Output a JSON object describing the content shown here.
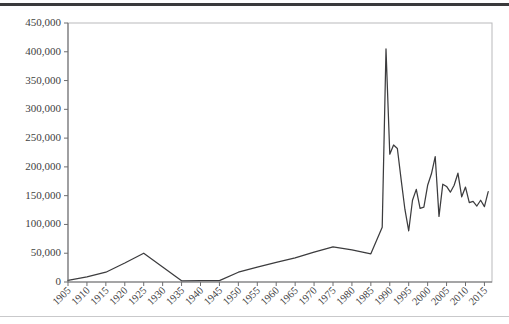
{
  "chart_data": {
    "type": "line",
    "title": "",
    "subtitle": "",
    "xlabel": "",
    "ylabel": "",
    "xlim": [
      1905,
      2017
    ],
    "ylim": [
      0,
      450000
    ],
    "grid": false,
    "legend": null,
    "legend_position": "none",
    "y_ticks": [
      0,
      50000,
      100000,
      150000,
      200000,
      250000,
      300000,
      350000,
      400000,
      450000
    ],
    "y_tick_labels": [
      "0",
      "50,000",
      "100,000",
      "150,000",
      "200,000",
      "250,000",
      "300,000",
      "350,000",
      "400,000",
      "450,000"
    ],
    "x_ticks": [
      1905,
      1910,
      1915,
      1920,
      1925,
      1930,
      1935,
      1940,
      1945,
      1950,
      1955,
      1960,
      1965,
      1970,
      1975,
      1980,
      1985,
      1990,
      1995,
      2000,
      2005,
      2010,
      2015
    ],
    "x_tick_labels": [
      "1905",
      "1910",
      "1915",
      "1920",
      "1925",
      "1930",
      "1935",
      "1940",
      "1945",
      "1950",
      "1955",
      "1960",
      "1965",
      "1970",
      "1975",
      "1980",
      "1985",
      "1990",
      "1995",
      "2000",
      "2005",
      "2010",
      "2015"
    ],
    "x_tick_label_rotation": -45,
    "series": [
      {
        "name": "series-1",
        "color": "#3c3c3e",
        "x": [
          1905,
          1910,
          1915,
          1920,
          1925,
          1930,
          1935,
          1940,
          1945,
          1950,
          1955,
          1960,
          1965,
          1970,
          1975,
          1980,
          1985,
          1988,
          1989,
          1990,
          1991,
          1992,
          1993,
          1994,
          1995,
          1996,
          1997,
          1998,
          1999,
          2000,
          2001,
          2002,
          2003,
          2004,
          2005,
          2006,
          2007,
          2008,
          2009,
          2010,
          2011,
          2012,
          2013,
          2014,
          2015,
          2016
        ],
        "y": [
          3000,
          9000,
          17000,
          33000,
          50000,
          26000,
          2000,
          2500,
          2500,
          17000,
          26000,
          34000,
          42000,
          52000,
          61000,
          56000,
          49000,
          95000,
          405000,
          222000,
          238000,
          232000,
          178000,
          126000,
          89000,
          142000,
          161000,
          128000,
          130000,
          168000,
          188000,
          218000,
          114000,
          170000,
          166000,
          156000,
          168000,
          189000,
          148000,
          165000,
          138000,
          140000,
          132000,
          142000,
          131000,
          157000
        ]
      }
    ]
  },
  "page": {
    "top_rule_color": "#3a3a3c",
    "bottom_rule_color": "#c9c9cb",
    "background_color": "#ffffff"
  }
}
